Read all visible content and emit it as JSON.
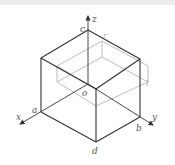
{
  "diagram": {
    "type": "isometric-box",
    "axes": {
      "x": "x",
      "y": "y",
      "z": "z"
    },
    "vertex_labels": {
      "origin": "o",
      "a": "a",
      "b": "b",
      "c": "c",
      "d": "d",
      "r": "r",
      "l": "l"
    },
    "colors": {
      "edge": "#333333",
      "inner_edge": "#b5b5b5",
      "axis": "#333333",
      "label": "#555555",
      "top_bar": "#ececec"
    }
  }
}
